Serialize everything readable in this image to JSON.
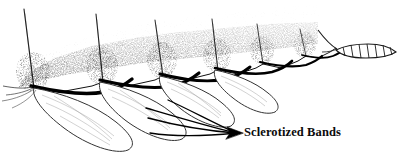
{
  "figure": {
    "kind": "scientific-line-illustration",
    "background_color": "#ffffff",
    "ink_color": "#000000",
    "width": 401,
    "height": 154
  },
  "callouts": [
    {
      "id": "sclerotized-bands",
      "text": "Sclerotized Bands",
      "text_x": 244,
      "text_y": 125,
      "arrow_tip_x": 236,
      "arrow_tip_y": 133,
      "leader_count": 4
    }
  ],
  "structures": {
    "segment_count": 6,
    "gill_count": 4,
    "spine_count": 6,
    "tail_rung_count": 7,
    "band_label": "Sclerotized Bands"
  },
  "colors": {
    "ink": "#000000",
    "stipple": "#1a1a1a",
    "faint_line": "#8a8a8a",
    "mid_line": "#454545",
    "background": "#ffffff"
  }
}
